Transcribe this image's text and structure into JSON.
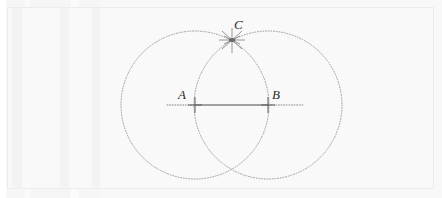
{
  "figure": {
    "background_color": "#f9f9f9",
    "stroke_color": "#9a9a9a",
    "segment_color": "#4a4a4a",
    "label_color": "#2b2b2b",
    "canvas": {
      "width": 442,
      "height": 198
    }
  },
  "points": [
    {
      "id": "A",
      "label": "A",
      "x": 195,
      "y": 105,
      "marker": "plus-cross-marker",
      "label_x": 178,
      "label_y": 88
    },
    {
      "id": "B",
      "label": "B",
      "x": 268,
      "y": 105,
      "marker": "plus-cross-marker",
      "label_x": 272,
      "label_y": 88
    },
    {
      "id": "C",
      "label": "C",
      "x": 232,
      "y": 40,
      "marker": "starburst-marker",
      "label_x": 234,
      "label_y": 18
    }
  ],
  "circles": [
    {
      "id": "circle-A",
      "center": "A",
      "cx": 195,
      "cy": 105,
      "r": 74,
      "style": "dotted"
    },
    {
      "id": "circle-B",
      "center": "B",
      "cx": 268,
      "cy": 105,
      "r": 74,
      "style": "dotted"
    }
  ],
  "segments": [
    {
      "id": "segment-AB",
      "from": "A",
      "to": "B",
      "x1": 195,
      "y1": 105,
      "x2": 268,
      "y2": 105,
      "style": "solid"
    },
    {
      "id": "ray-left",
      "x1": 167,
      "y1": 105,
      "x2": 195,
      "y2": 105,
      "style": "dotted"
    },
    {
      "id": "ray-right",
      "x1": 268,
      "y1": 105,
      "x2": 303,
      "y2": 105,
      "style": "dotted"
    }
  ]
}
